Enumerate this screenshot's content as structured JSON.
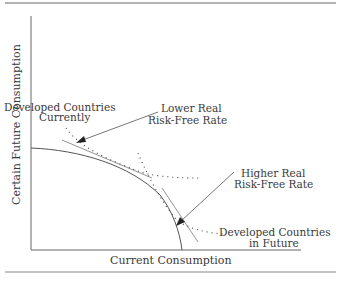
{
  "diagram": {
    "axes": {
      "x_label": "Current Consumption",
      "y_label": "Certain Future Consumption"
    },
    "annotations": {
      "developed_current_line1": "Developed Countries",
      "developed_current_line2": "Currently",
      "lower_rate_line1": "Lower Real",
      "lower_rate_line2": "Risk-Free Rate",
      "higher_rate_line1": "Higher Real",
      "higher_rate_line2": "Risk-Free Rate",
      "developed_future_line1": "Developed Countries",
      "developed_future_line2": "in Future"
    },
    "elements": {
      "curve": "production possibility frontier (concave)",
      "indifference_curves": [
        "current (dotted)",
        "future (dotted)"
      ],
      "tangent_lines": [
        "lower real risk-free rate",
        "higher real risk-free rate"
      ]
    },
    "colors": {
      "line": "#555555",
      "text": "#3a3a3a",
      "rule": "#777777"
    }
  }
}
